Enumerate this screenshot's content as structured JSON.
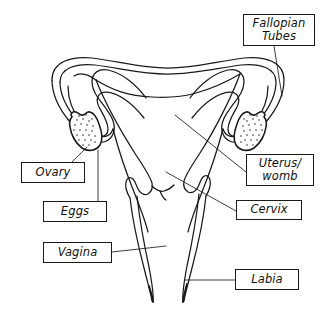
{
  "diagram": {
    "background_color": "#ffffff",
    "line_color": "#1a1a1a",
    "labels": [
      {
        "id": "fallopian-tubes",
        "text": "Fallopian\nTubes",
        "lines": [
          "Fallopian",
          "Tubes"
        ]
      },
      {
        "id": "uterus-womb",
        "text": "Uterus/\nwomb",
        "lines": [
          "Uterus/",
          "womb"
        ]
      },
      {
        "id": "cervix",
        "text": "Cervix",
        "lines": [
          "Cervix"
        ]
      },
      {
        "id": "ovary",
        "text": "Ovary",
        "lines": [
          "Ovary"
        ]
      },
      {
        "id": "eggs",
        "text": "Eggs",
        "lines": [
          "Eggs"
        ]
      },
      {
        "id": "vagina",
        "text": "Vagina",
        "lines": [
          "Vagina"
        ]
      },
      {
        "id": "labia",
        "text": "Labia",
        "lines": [
          "Labia"
        ]
      }
    ],
    "parts": [
      "fallopian-tube-left",
      "fallopian-tube-right",
      "ovary-left",
      "ovary-right",
      "uterus-fundus",
      "uterine-cavity",
      "cervix",
      "vaginal-canal",
      "labia"
    ]
  }
}
